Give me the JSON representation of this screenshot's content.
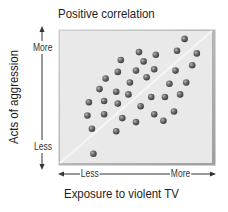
{
  "chart_data": {
    "type": "scatter",
    "title": "Positive correlation",
    "xlabel": "Exposure to violent TV",
    "ylabel": "Acts of aggression",
    "x_ticks": [
      "Less",
      "More"
    ],
    "y_ticks": [
      "More",
      "Less"
    ],
    "xlim": [
      0,
      100
    ],
    "ylim": [
      0,
      100
    ],
    "grid": false,
    "legend": null,
    "trend_line": {
      "from": [
        0,
        0
      ],
      "to": [
        100,
        100
      ],
      "color": "#f4f4f4"
    },
    "colors": {
      "plot_background": "#e9e9e9",
      "point": "#6a6a6a",
      "frame": "#bdbdbd"
    },
    "points": [
      {
        "x": 82,
        "y": 94
      },
      {
        "x": 52,
        "y": 84
      },
      {
        "x": 63,
        "y": 82
      },
      {
        "x": 77,
        "y": 85
      },
      {
        "x": 90,
        "y": 83
      },
      {
        "x": 40,
        "y": 78
      },
      {
        "x": 55,
        "y": 77
      },
      {
        "x": 87,
        "y": 74
      },
      {
        "x": 38,
        "y": 69
      },
      {
        "x": 50,
        "y": 70
      },
      {
        "x": 62,
        "y": 71
      },
      {
        "x": 76,
        "y": 70
      },
      {
        "x": 30,
        "y": 64
      },
      {
        "x": 46,
        "y": 61
      },
      {
        "x": 57,
        "y": 65
      },
      {
        "x": 72,
        "y": 60
      },
      {
        "x": 83,
        "y": 61
      },
      {
        "x": 26,
        "y": 56
      },
      {
        "x": 37,
        "y": 54
      },
      {
        "x": 45,
        "y": 52
      },
      {
        "x": 60,
        "y": 50
      },
      {
        "x": 69,
        "y": 50
      },
      {
        "x": 79,
        "y": 52
      },
      {
        "x": 19,
        "y": 46
      },
      {
        "x": 29,
        "y": 47
      },
      {
        "x": 38,
        "y": 45
      },
      {
        "x": 53,
        "y": 43
      },
      {
        "x": 18,
        "y": 36
      },
      {
        "x": 29,
        "y": 37
      },
      {
        "x": 41,
        "y": 34
      },
      {
        "x": 62,
        "y": 37
      },
      {
        "x": 75,
        "y": 39
      },
      {
        "x": 50,
        "y": 31
      },
      {
        "x": 68,
        "y": 32
      },
      {
        "x": 21,
        "y": 26
      },
      {
        "x": 37,
        "y": 24
      },
      {
        "x": 22,
        "y": 7
      }
    ]
  }
}
